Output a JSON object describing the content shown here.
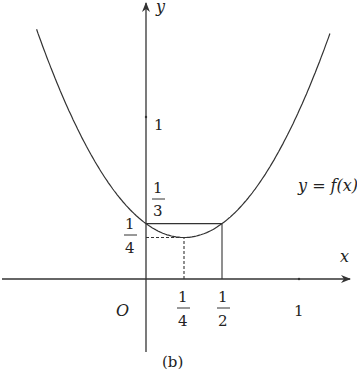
{
  "chart_data": {
    "type": "line",
    "title": "",
    "caption": "(b)",
    "xlabel": "x",
    "ylabel": "y",
    "origin_label": "O",
    "curve_label": "y = f(x)",
    "function": "f(x) = 4/3 (x - 1/4)^2 + 1/4",
    "x_ticks": [
      {
        "value": 0.25,
        "label": "1/4"
      },
      {
        "value": 0.5,
        "label": "1/2"
      },
      {
        "value": 1,
        "label": "1"
      }
    ],
    "y_ticks": [
      {
        "value": 0.25,
        "label": "1/4"
      },
      {
        "value": 0.3333,
        "label": "1/3"
      },
      {
        "value": 1,
        "label": "1"
      }
    ],
    "vertex": {
      "x": 0.25,
      "y": 0.25
    },
    "points": [
      {
        "x": 0,
        "y": 0.3333
      },
      {
        "x": 0.25,
        "y": 0.25
      },
      {
        "x": 0.5,
        "y": 0.3333
      }
    ],
    "guide_lines": [
      {
        "style": "solid",
        "from": [
          0,
          0.3333
        ],
        "to": [
          0.5,
          0.3333
        ]
      },
      {
        "style": "solid",
        "from": [
          0.5,
          0
        ],
        "to": [
          0.5,
          0.3333
        ]
      },
      {
        "style": "dashed",
        "from": [
          0,
          0.25
        ],
        "to": [
          0.25,
          0.25
        ]
      },
      {
        "style": "dashed",
        "from": [
          0.25,
          0
        ],
        "to": [
          0.25,
          0.25
        ]
      }
    ],
    "xlim": [
      -0.95,
      1.35
    ],
    "ylim": [
      -0.45,
      1.65
    ],
    "grid": false
  },
  "labels": {
    "y_axis": "y",
    "x_axis": "x",
    "origin": "O",
    "y_one": "1",
    "x_one": "1",
    "curve": "y = f(x)",
    "caption": "(b)",
    "one": "1",
    "three": "3",
    "four": "4",
    "two": "2"
  }
}
